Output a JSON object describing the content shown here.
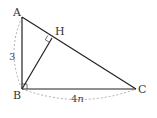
{
  "diagram": {
    "type": "geometry",
    "points": {
      "A": {
        "label": "A",
        "x": 22,
        "y": 17
      },
      "B": {
        "label": "B",
        "x": 22,
        "y": 89
      },
      "C": {
        "label": "C",
        "x": 136,
        "y": 89
      },
      "H": {
        "label": "H",
        "x": 52,
        "y": 38
      }
    },
    "segments": [
      {
        "from": "A",
        "to": "B"
      },
      {
        "from": "B",
        "to": "C"
      },
      {
        "from": "A",
        "to": "C"
      },
      {
        "from": "B",
        "to": "H"
      }
    ],
    "right_angles": [
      "B",
      "H"
    ],
    "dimensions": {
      "AB": {
        "value": "3"
      },
      "BC": {
        "value_num": "4",
        "value_var": "n"
      }
    },
    "colors": {
      "line": "#222222",
      "dashed": "#999999"
    }
  }
}
